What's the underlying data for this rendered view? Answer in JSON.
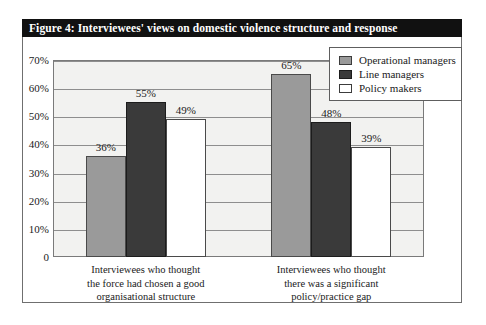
{
  "figure": {
    "title": "Figure 4: Interviewees' views on domestic violence structure and response",
    "title_bar_color": "#111111",
    "title_text_color": "#ffffff",
    "frame_border_color": "#6f6f6f"
  },
  "legend": {
    "position": "top-right",
    "entries": [
      {
        "label": "Operational managers",
        "color": "#9a9a9a"
      },
      {
        "label": "Line managers",
        "color": "#3a3a3a"
      },
      {
        "label": "Policy makers",
        "color": "#ffffff"
      }
    ]
  },
  "axis": {
    "y_ticks": [
      "70%",
      "60%",
      "50%",
      "40%",
      "30%",
      "20%",
      "10%",
      "0"
    ],
    "y_values": [
      70,
      60,
      50,
      40,
      30,
      20,
      10,
      0
    ]
  },
  "chart_data": {
    "type": "bar",
    "title": "Figure 4: Interviewees' views on domestic violence structure and response",
    "xlabel": "",
    "ylabel": "",
    "ylim": [
      0,
      70
    ],
    "ytick_labels": [
      "0",
      "10%",
      "20%",
      "30%",
      "40%",
      "50%",
      "60%",
      "70%"
    ],
    "grid": true,
    "legend_position": "upper right",
    "categories": [
      "Interviewees who thought\nthe force had chosen a good\norganisational structure",
      "Interviewees who thought\nthere was a significant\npolicy/practice gap"
    ],
    "series": [
      {
        "name": "Operational managers",
        "color": "#9a9a9a",
        "values": [
          36,
          65
        ],
        "data_labels": [
          "36%",
          "65%"
        ]
      },
      {
        "name": "Line managers",
        "color": "#3a3a3a",
        "values": [
          55,
          48
        ],
        "data_labels": [
          "55%",
          "48%"
        ]
      },
      {
        "name": "Policy makers",
        "color": "#ffffff",
        "values": [
          49,
          39
        ],
        "data_labels": [
          "49%",
          "39%"
        ]
      }
    ]
  }
}
